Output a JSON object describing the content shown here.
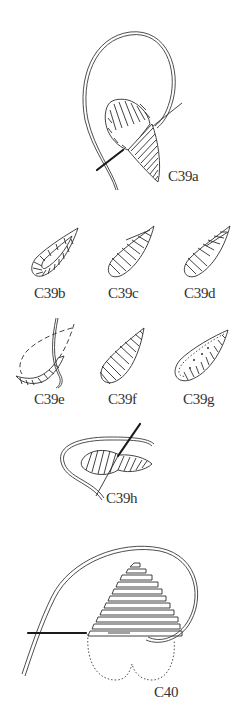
{
  "figure": {
    "background_color": "#ffffff",
    "ink_color": "#2e2e2e"
  },
  "panels": [
    {
      "id": "C39a",
      "label": "C39a",
      "description": "leaf with padding stitches, needle and looped thread, satin stitch beginning at tip"
    },
    {
      "id": "C39b",
      "label": "C39b",
      "description": "leaf outlined with split stitch border"
    },
    {
      "id": "C39c",
      "label": "C39c",
      "description": "leaf with slanted satin stitch over padding"
    },
    {
      "id": "C39d",
      "label": "C39d",
      "description": "leaf with slanted satin stitch, variation"
    },
    {
      "id": "C39e",
      "label": "C39e",
      "description": "leaf outline with running stitches and thread"
    },
    {
      "id": "C39f",
      "label": "C39f",
      "description": "completed leaf in slanted satin stitch"
    },
    {
      "id": "C39g",
      "label": "C39g",
      "description": "leaf with outline and seed stitch filling"
    },
    {
      "id": "C39h",
      "label": "C39h",
      "description": "horizontal leaf being worked with needle and thread"
    },
    {
      "id": "C40",
      "label": "C40",
      "description": "heart shape in horizontal satin stitch with needle, looped thread and dotted lower outline"
    }
  ]
}
